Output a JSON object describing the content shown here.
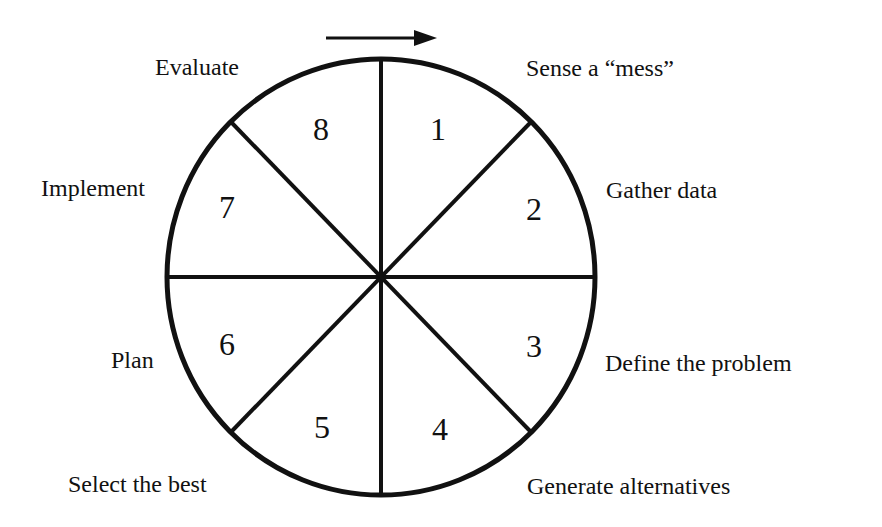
{
  "diagram": {
    "type": "cycle-wheel",
    "direction": "clockwise",
    "segments": [
      {
        "number": "1",
        "label": "Sense a “mess”"
      },
      {
        "number": "2",
        "label": "Gather data"
      },
      {
        "number": "3",
        "label": "Define the problem"
      },
      {
        "number": "4",
        "label": "Generate alternatives"
      },
      {
        "number": "5",
        "label": "Select the best"
      },
      {
        "number": "6",
        "label": "Plan"
      },
      {
        "number": "7",
        "label": "Implement"
      },
      {
        "number": "8",
        "label": "Evaluate"
      }
    ],
    "colors": {
      "stroke": "#111111",
      "background": "#ffffff"
    }
  }
}
